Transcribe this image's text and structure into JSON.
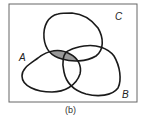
{
  "diagram": {
    "type": "venn",
    "universe_frame": {
      "stroke": "#666666"
    },
    "sets": [
      {
        "name": "A",
        "label": "A"
      },
      {
        "name": "B",
        "label": "B"
      },
      {
        "name": "C",
        "label": "C"
      }
    ],
    "shaded_region": "A ∩ C",
    "shade_color": "#999999",
    "curve_color": "#1a1a1a",
    "caption": "(b)"
  }
}
